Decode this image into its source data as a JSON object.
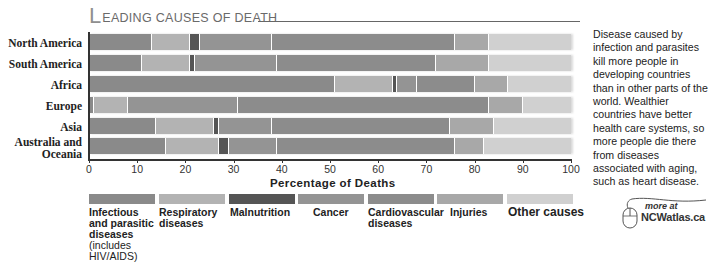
{
  "title": {
    "initial": "L",
    "rest": "EADING CAUSES OF DEATH"
  },
  "chart_data": {
    "type": "bar",
    "orientation": "horizontal",
    "stacked": true,
    "xlabel": "Percentage of Deaths",
    "ylabel": "",
    "xlim": [
      0,
      100
    ],
    "xticks": [
      0,
      10,
      20,
      30,
      40,
      50,
      60,
      70,
      80,
      90,
      100
    ],
    "grid": false,
    "legend_position": "bottom",
    "categories": [
      "North America",
      "South America",
      "Africa",
      "Europe",
      "Asia",
      "Australia and Oceania"
    ],
    "series": [
      {
        "name": "Infectious and parasitic diseases (includes HIV/AIDS)",
        "color": "#8a8a8a",
        "values": [
          13,
          11,
          51,
          1,
          14,
          16
        ]
      },
      {
        "name": "Respiratory diseases",
        "color": "#b3b3b3",
        "values": [
          8,
          10,
          12,
          7,
          12,
          11
        ]
      },
      {
        "name": "Malnutrition",
        "color": "#555555",
        "values": [
          2,
          1,
          1,
          0,
          1,
          2
        ]
      },
      {
        "name": "Cancer",
        "color": "#949494",
        "values": [
          15,
          17,
          4,
          23,
          11,
          10
        ]
      },
      {
        "name": "Cardiovascular diseases",
        "color": "#8c8c8c",
        "values": [
          38,
          33,
          12,
          52,
          37,
          37
        ]
      },
      {
        "name": "Injuries",
        "color": "#a8a8a8",
        "values": [
          7,
          11,
          7,
          7,
          9,
          6
        ]
      },
      {
        "name": "Other causes",
        "color": "#d0d0d0",
        "values": [
          17,
          17,
          13,
          10,
          16,
          18
        ]
      }
    ]
  },
  "rows": [
    {
      "label": "North America"
    },
    {
      "label": "South America"
    },
    {
      "label": "Africa"
    },
    {
      "label": "Europe"
    },
    {
      "label": "Asia"
    },
    {
      "label_line1": "Australia and",
      "label_line2": "Oceania"
    }
  ],
  "legend": [
    {
      "line1": "Infectious",
      "line2": "and parasitic",
      "line3": "diseases",
      "sub1": "(includes",
      "sub2": "HIV/AIDS)"
    },
    {
      "line1": "Respiratory",
      "line2": "diseases"
    },
    {
      "line1": "Malnutrition"
    },
    {
      "line1": "Cancer"
    },
    {
      "line1": "Cardiovascular",
      "line2": "diseases"
    },
    {
      "line1": "Injuries"
    },
    {
      "line1": "Other causes"
    }
  ],
  "note": "Disease caused by infection and parasites kill more people in developing countries than in other parts of the world. Wealthier countries have better health care systems, so more people die there from diseases associated with aging, such as heart disease.",
  "more_link": {
    "prefix": "more at",
    "site": "NCWatlas.ca"
  }
}
